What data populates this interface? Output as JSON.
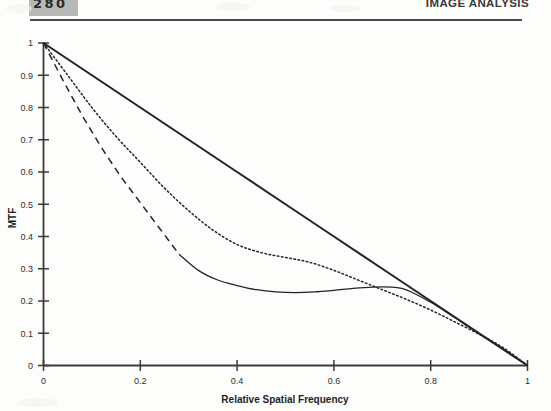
{
  "header": {
    "page_number": "280",
    "chapter_title": "IMAGE ANALYSIS"
  },
  "figure": {
    "xlabel": "Relative Spatial Frequency",
    "ylabel": "MTF"
  },
  "chart_data": {
    "type": "line",
    "title": "",
    "xlabel": "Relative Spatial Frequency",
    "ylabel": "MTF",
    "xlim": [
      0,
      1
    ],
    "ylim": [
      0,
      1
    ],
    "xticks": [
      0,
      0.2,
      0.4,
      0.6,
      0.8,
      1
    ],
    "xticklabels": [
      "0",
      "0.2",
      "0.4",
      "0.6",
      "0.8",
      "1"
    ],
    "yticks": [
      0,
      0.1,
      0.2,
      0.3,
      0.4,
      0.5,
      0.6,
      0.7,
      0.8,
      0.9,
      1
    ],
    "yticklabels": [
      "0",
      "0.1",
      "0.2",
      "0.3",
      "0.4",
      "0.5",
      "0.6",
      "0.7",
      "0.8",
      "0.9",
      "1"
    ],
    "grid": false,
    "legend": "none",
    "accent_color": "#242424",
    "series": [
      {
        "name": "ideal-mtf-solid-thick",
        "style": "solid-thick",
        "x": [
          0,
          0.1,
          0.2,
          0.3,
          0.4,
          0.5,
          0.6,
          0.7,
          0.8,
          0.9,
          1
        ],
        "y": [
          1.0,
          0.9,
          0.8,
          0.7,
          0.6,
          0.5,
          0.4,
          0.3,
          0.2,
          0.1,
          0.0
        ]
      },
      {
        "name": "mtf-dotted",
        "style": "dotted",
        "x": [
          0,
          0.05,
          0.1,
          0.15,
          0.2,
          0.25,
          0.3,
          0.35,
          0.4,
          0.45,
          0.5,
          0.55,
          0.6,
          0.65,
          0.7,
          0.75,
          0.8,
          0.85,
          0.9,
          0.95,
          1
        ],
        "y": [
          1.0,
          0.9,
          0.8,
          0.71,
          0.63,
          0.55,
          0.48,
          0.42,
          0.375,
          0.35,
          0.335,
          0.32,
          0.295,
          0.265,
          0.235,
          0.205,
          0.172,
          0.135,
          0.097,
          0.055,
          0.0
        ]
      },
      {
        "name": "mtf-dashed",
        "style": "dashed",
        "x": [
          0,
          0.04,
          0.08,
          0.12,
          0.16,
          0.2,
          0.24,
          0.28
        ],
        "y": [
          1.0,
          0.885,
          0.775,
          0.675,
          0.585,
          0.505,
          0.425,
          0.345
        ]
      },
      {
        "name": "mtf-solid-thin",
        "style": "solid-thin",
        "x": [
          0.28,
          0.32,
          0.36,
          0.4,
          0.44,
          0.48,
          0.52,
          0.56,
          0.6,
          0.64,
          0.68,
          0.72,
          0.74,
          0.76,
          0.8,
          0.84,
          0.88,
          0.92,
          0.96,
          1
        ],
        "y": [
          0.345,
          0.295,
          0.265,
          0.248,
          0.235,
          0.228,
          0.226,
          0.228,
          0.233,
          0.239,
          0.243,
          0.243,
          0.239,
          0.228,
          0.196,
          0.158,
          0.118,
          0.078,
          0.039,
          0.0
        ]
      }
    ]
  }
}
